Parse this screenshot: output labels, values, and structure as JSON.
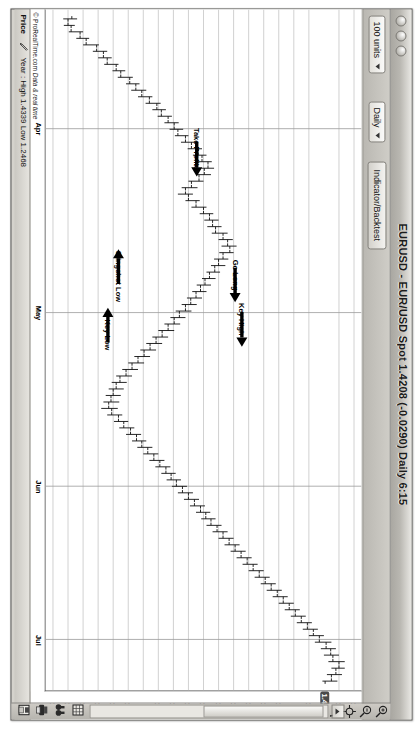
{
  "window": {
    "title": "EURUSD - EUR/USD Spot  1.4208 (-0.0290)   Daily  6:15",
    "dots": [
      "close-dot",
      "minimize-dot",
      "zoom-dot"
    ]
  },
  "toolbar": {
    "units_label": "100 units",
    "timeframe_label": "Daily",
    "indicator_button_label": "Indicator/Backtest"
  },
  "statusbar": {
    "price_label": "Price",
    "pen_icon": "pencil-icon",
    "stats_label": "Year : High 1.4339 Low 1.2468"
  },
  "plot": {
    "copyright_prefix": "© ProRealTime.com ",
    "copyright_italic": "Data & real time"
  },
  "right_toolbar": {
    "icons": [
      {
        "name": "zoom-in-icon",
        "title": "Zoom in"
      },
      {
        "name": "zoom-out-icon",
        "title": "Zoom out"
      },
      {
        "name": "crosshair-icon",
        "title": "Crosshair"
      },
      {
        "name": "undo-icon",
        "title": "Undo"
      }
    ],
    "bottom_icons": [
      {
        "name": "grid-icon",
        "title": "Grid"
      },
      {
        "name": "binoculars-icon",
        "title": "Compare"
      },
      {
        "name": "print-icon",
        "title": "Print"
      },
      {
        "name": "save-icon",
        "title": "Save"
      }
    ],
    "scroll_up_icon": "scroll-up-icon"
  },
  "chart_data": {
    "type": "ohlc",
    "xlabel": "",
    "ylabel": "Price",
    "grid": true,
    "ylim": [
      1.235,
      1.445
    ],
    "y_ticks": [
      "1.44",
      "1.43",
      "1.41",
      "1.4",
      "1.39",
      "1.38",
      "1.37",
      "1.36",
      "1.35",
      "1.34",
      "1.33",
      "1.32",
      "1.31",
      "1.3",
      "1.29",
      "1.28",
      "1.27",
      "1.26",
      "1.25",
      "1.24"
    ],
    "y_tick_values": [
      1.44,
      1.43,
      1.41,
      1.4,
      1.39,
      1.38,
      1.37,
      1.36,
      1.35,
      1.34,
      1.33,
      1.32,
      1.31,
      1.3,
      1.29,
      1.28,
      1.27,
      1.26,
      1.25,
      1.24
    ],
    "highlighted_price": "1.4208",
    "highlighted_price_value": 1.4208,
    "x_ticks": [
      "Apr",
      "May",
      "Jun",
      "Jul"
    ],
    "x_tick_positions": [
      0.175,
      0.445,
      0.7,
      0.925
    ],
    "year_high": 1.4339,
    "year_low": 1.2468,
    "last_close": 1.4208,
    "change": -0.029,
    "annotations": [
      {
        "label": "Take Profits",
        "x": 0.205,
        "y": 1.3355,
        "arrow": "right",
        "arrow_x": 0.245,
        "arrow_y": 1.3355
      },
      {
        "label": "Go Long",
        "x": 0.39,
        "y": 1.361,
        "arrow": "right",
        "arrow_x": 0.43,
        "arrow_y": 1.361
      },
      {
        "label": "Key High",
        "x": 0.455,
        "y": 1.3655,
        "arrow": "right",
        "arrow_x": 0.495,
        "arrow_y": 1.3655
      },
      {
        "label": "Slingshot Low",
        "x": 0.392,
        "y": 1.2835,
        "arrow": "left",
        "arrow_x": 0.352,
        "arrow_y": 1.2835
      },
      {
        "label": "Key Low",
        "x": 0.478,
        "y": 1.2765,
        "arrow": "left",
        "arrow_x": 0.438,
        "arrow_y": 1.2765
      }
    ],
    "bars": [
      {
        "o": 1.2525,
        "h": 1.256,
        "l": 1.2468,
        "c": 1.25
      },
      {
        "o": 1.25,
        "h": 1.2545,
        "l": 1.2472,
        "c": 1.252
      },
      {
        "o": 1.252,
        "h": 1.26,
        "l": 1.2505,
        "c": 1.258
      },
      {
        "o": 1.258,
        "h": 1.264,
        "l": 1.2555,
        "c": 1.262
      },
      {
        "o": 1.262,
        "h": 1.2705,
        "l": 1.26,
        "c": 1.269
      },
      {
        "o": 1.269,
        "h": 1.276,
        "l": 1.2665,
        "c": 1.2735
      },
      {
        "o": 1.2735,
        "h": 1.279,
        "l": 1.27,
        "c": 1.276
      },
      {
        "o": 1.276,
        "h": 1.2835,
        "l": 1.274,
        "c": 1.282
      },
      {
        "o": 1.282,
        "h": 1.288,
        "l": 1.2795,
        "c": 1.285
      },
      {
        "o": 1.285,
        "h": 1.293,
        "l": 1.283,
        "c": 1.291
      },
      {
        "o": 1.291,
        "h": 1.2975,
        "l": 1.2885,
        "c": 1.295
      },
      {
        "o": 1.295,
        "h": 1.302,
        "l": 1.292,
        "c": 1.299
      },
      {
        "o": 1.299,
        "h": 1.306,
        "l": 1.2965,
        "c": 1.304
      },
      {
        "o": 1.304,
        "h": 1.3115,
        "l": 1.3015,
        "c": 1.309
      },
      {
        "o": 1.309,
        "h": 1.315,
        "l": 1.306,
        "c": 1.312
      },
      {
        "o": 1.312,
        "h": 1.319,
        "l": 1.3095,
        "c": 1.3165
      },
      {
        "o": 1.3165,
        "h": 1.3235,
        "l": 1.314,
        "c": 1.3205
      },
      {
        "o": 1.3205,
        "h": 1.3265,
        "l": 1.3175,
        "c": 1.323
      },
      {
        "o": 1.323,
        "h": 1.33,
        "l": 1.321,
        "c": 1.328
      },
      {
        "o": 1.328,
        "h": 1.3345,
        "l": 1.325,
        "c": 1.332
      },
      {
        "o": 1.332,
        "h": 1.339,
        "l": 1.3295,
        "c": 1.3365
      },
      {
        "o": 1.3365,
        "h": 1.342,
        "l": 1.333,
        "c": 1.339
      },
      {
        "o": 1.339,
        "h": 1.3455,
        "l": 1.3365,
        "c": 1.343
      },
      {
        "o": 1.343,
        "h": 1.347,
        "l": 1.3385,
        "c": 1.3405
      },
      {
        "o": 1.3405,
        "h": 1.345,
        "l": 1.335,
        "c": 1.337
      },
      {
        "o": 1.337,
        "h": 1.34,
        "l": 1.33,
        "c": 1.332
      },
      {
        "o": 1.332,
        "h": 1.336,
        "l": 1.3255,
        "c": 1.328
      },
      {
        "o": 1.328,
        "h": 1.333,
        "l": 1.323,
        "c": 1.33
      },
      {
        "o": 1.33,
        "h": 1.3375,
        "l": 1.328,
        "c": 1.335
      },
      {
        "o": 1.335,
        "h": 1.342,
        "l": 1.332,
        "c": 1.34
      },
      {
        "o": 1.34,
        "h": 1.3465,
        "l": 1.3375,
        "c": 1.344
      },
      {
        "o": 1.344,
        "h": 1.35,
        "l": 1.3405,
        "c": 1.346
      },
      {
        "o": 1.346,
        "h": 1.352,
        "l": 1.3425,
        "c": 1.348
      },
      {
        "o": 1.348,
        "h": 1.356,
        "l": 1.3455,
        "c": 1.353
      },
      {
        "o": 1.353,
        "h": 1.3595,
        "l": 1.35,
        "c": 1.356
      },
      {
        "o": 1.356,
        "h": 1.362,
        "l": 1.352,
        "c": 1.3575
      },
      {
        "o": 1.3575,
        "h": 1.36,
        "l": 1.3505,
        "c": 1.353
      },
      {
        "o": 1.353,
        "h": 1.3565,
        "l": 1.347,
        "c": 1.35
      },
      {
        "o": 1.35,
        "h": 1.3545,
        "l": 1.345,
        "c": 1.3475
      },
      {
        "o": 1.3475,
        "h": 1.351,
        "l": 1.342,
        "c": 1.344
      },
      {
        "o": 1.344,
        "h": 1.348,
        "l": 1.339,
        "c": 1.341
      },
      {
        "o": 1.341,
        "h": 1.345,
        "l": 1.3355,
        "c": 1.338
      },
      {
        "o": 1.338,
        "h": 1.342,
        "l": 1.3325,
        "c": 1.335
      },
      {
        "o": 1.335,
        "h": 1.339,
        "l": 1.329,
        "c": 1.3315
      },
      {
        "o": 1.3315,
        "h": 1.3355,
        "l": 1.3255,
        "c": 1.328
      },
      {
        "o": 1.328,
        "h": 1.332,
        "l": 1.3215,
        "c": 1.324
      },
      {
        "o": 1.324,
        "h": 1.328,
        "l": 1.318,
        "c": 1.3205
      },
      {
        "o": 1.3205,
        "h": 1.3245,
        "l": 1.314,
        "c": 1.3165
      },
      {
        "o": 1.3165,
        "h": 1.3205,
        "l": 1.31,
        "c": 1.3125
      },
      {
        "o": 1.3125,
        "h": 1.3165,
        "l": 1.306,
        "c": 1.3085
      },
      {
        "o": 1.3085,
        "h": 1.3125,
        "l": 1.302,
        "c": 1.3045
      },
      {
        "o": 1.3045,
        "h": 1.3085,
        "l": 1.298,
        "c": 1.3005
      },
      {
        "o": 1.3005,
        "h": 1.3045,
        "l": 1.294,
        "c": 1.2965
      },
      {
        "o": 1.2965,
        "h": 1.3005,
        "l": 1.29,
        "c": 1.2925
      },
      {
        "o": 1.2925,
        "h": 1.2965,
        "l": 1.286,
        "c": 1.2885
      },
      {
        "o": 1.2885,
        "h": 1.2925,
        "l": 1.282,
        "c": 1.2845
      },
      {
        "o": 1.2845,
        "h": 1.289,
        "l": 1.279,
        "c": 1.282
      },
      {
        "o": 1.282,
        "h": 1.287,
        "l": 1.277,
        "c": 1.28
      },
      {
        "o": 1.28,
        "h": 1.285,
        "l": 1.275,
        "c": 1.2785
      },
      {
        "o": 1.2785,
        "h": 1.284,
        "l": 1.2735,
        "c": 1.277
      },
      {
        "o": 1.277,
        "h": 1.283,
        "l": 1.272,
        "c": 1.279
      },
      {
        "o": 1.279,
        "h": 1.286,
        "l": 1.276,
        "c": 1.2835
      },
      {
        "o": 1.2835,
        "h": 1.29,
        "l": 1.2805,
        "c": 1.287
      },
      {
        "o": 1.287,
        "h": 1.294,
        "l": 1.284,
        "c": 1.2915
      },
      {
        "o": 1.2915,
        "h": 1.2985,
        "l": 1.2885,
        "c": 1.2955
      },
      {
        "o": 1.2955,
        "h": 1.302,
        "l": 1.2925,
        "c": 1.299
      },
      {
        "o": 1.299,
        "h": 1.306,
        "l": 1.296,
        "c": 1.303
      },
      {
        "o": 1.303,
        "h": 1.31,
        "l": 1.3,
        "c": 1.307
      },
      {
        "o": 1.307,
        "h": 1.314,
        "l": 1.304,
        "c": 1.311
      },
      {
        "o": 1.311,
        "h": 1.318,
        "l": 1.308,
        "c": 1.315
      },
      {
        "o": 1.315,
        "h": 1.3215,
        "l": 1.312,
        "c": 1.3185
      },
      {
        "o": 1.3185,
        "h": 1.325,
        "l": 1.3155,
        "c": 1.322
      },
      {
        "o": 1.322,
        "h": 1.329,
        "l": 1.319,
        "c": 1.326
      },
      {
        "o": 1.326,
        "h": 1.333,
        "l": 1.323,
        "c": 1.33
      },
      {
        "o": 1.33,
        "h": 1.337,
        "l": 1.327,
        "c": 1.334
      },
      {
        "o": 1.334,
        "h": 1.341,
        "l": 1.331,
        "c": 1.338
      },
      {
        "o": 1.338,
        "h": 1.3445,
        "l": 1.335,
        "c": 1.3415
      },
      {
        "o": 1.3415,
        "h": 1.348,
        "l": 1.3385,
        "c": 1.345
      },
      {
        "o": 1.345,
        "h": 1.352,
        "l": 1.342,
        "c": 1.349
      },
      {
        "o": 1.349,
        "h": 1.356,
        "l": 1.346,
        "c": 1.353
      },
      {
        "o": 1.353,
        "h": 1.36,
        "l": 1.35,
        "c": 1.357
      },
      {
        "o": 1.357,
        "h": 1.364,
        "l": 1.354,
        "c": 1.361
      },
      {
        "o": 1.361,
        "h": 1.368,
        "l": 1.358,
        "c": 1.365
      },
      {
        "o": 1.365,
        "h": 1.372,
        "l": 1.362,
        "c": 1.369
      },
      {
        "o": 1.369,
        "h": 1.376,
        "l": 1.366,
        "c": 1.373
      },
      {
        "o": 1.373,
        "h": 1.38,
        "l": 1.37,
        "c": 1.377
      },
      {
        "o": 1.377,
        "h": 1.384,
        "l": 1.374,
        "c": 1.381
      },
      {
        "o": 1.381,
        "h": 1.388,
        "l": 1.378,
        "c": 1.385
      },
      {
        "o": 1.385,
        "h": 1.392,
        "l": 1.382,
        "c": 1.389
      },
      {
        "o": 1.389,
        "h": 1.396,
        "l": 1.386,
        "c": 1.393
      },
      {
        "o": 1.393,
        "h": 1.4,
        "l": 1.39,
        "c": 1.397
      },
      {
        "o": 1.397,
        "h": 1.404,
        "l": 1.394,
        "c": 1.401
      },
      {
        "o": 1.401,
        "h": 1.408,
        "l": 1.398,
        "c": 1.405
      },
      {
        "o": 1.405,
        "h": 1.412,
        "l": 1.402,
        "c": 1.409
      },
      {
        "o": 1.409,
        "h": 1.416,
        "l": 1.406,
        "c": 1.413
      },
      {
        "o": 1.413,
        "h": 1.42,
        "l": 1.41,
        "c": 1.417
      },
      {
        "o": 1.417,
        "h": 1.425,
        "l": 1.414,
        "c": 1.4215
      },
      {
        "o": 1.4215,
        "h": 1.428,
        "l": 1.418,
        "c": 1.4245
      },
      {
        "o": 1.4245,
        "h": 1.43,
        "l": 1.42,
        "c": 1.426
      },
      {
        "o": 1.426,
        "h": 1.4339,
        "l": 1.423,
        "c": 1.43
      },
      {
        "o": 1.43,
        "h": 1.4339,
        "l": 1.425,
        "c": 1.428
      },
      {
        "o": 1.428,
        "h": 1.432,
        "l": 1.422,
        "c": 1.425
      },
      {
        "o": 1.425,
        "h": 1.429,
        "l": 1.419,
        "c": 1.4208
      }
    ]
  }
}
